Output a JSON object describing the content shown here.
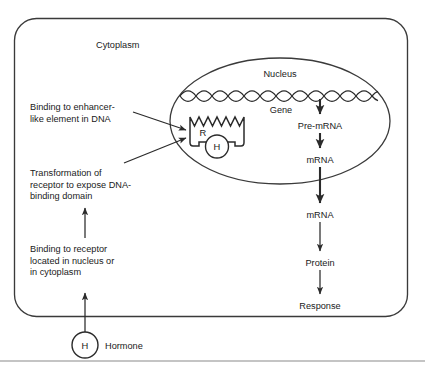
{
  "figure": {
    "compartments": {
      "cytoplasm_label": "Cytoplasm",
      "nucleus_label": "Nucleus"
    },
    "molecules": {
      "receptor_glyph": "R",
      "hormone_glyph": "H",
      "hormone_inside_glyph": "H",
      "hormone_label": "Hormone"
    },
    "pathway": {
      "gene_label": "Gene",
      "steps": [
        {
          "label": "Pre-mRNA"
        },
        {
          "label": "mRNA"
        },
        {
          "label": "mRNA"
        },
        {
          "label": "Protein"
        },
        {
          "label": "Response"
        }
      ]
    },
    "annotations": [
      {
        "id": "enhancer-binding",
        "lines": [
          "Binding to enhancer-",
          "like element in DNA"
        ]
      },
      {
        "id": "receptor-transformation",
        "lines": [
          "Transformation of",
          "receptor to expose DNA-",
          "binding domain"
        ]
      },
      {
        "id": "receptor-binding",
        "lines": [
          "Binding to receptor",
          "located in nucleus or",
          "in cytoplasm"
        ]
      }
    ],
    "colors": {
      "ink": "#1a1a1a",
      "stroke": "#2b2b2b",
      "membrane": "#3a3a3a",
      "rule": "#8a8a8a",
      "background": "#ffffff"
    }
  }
}
